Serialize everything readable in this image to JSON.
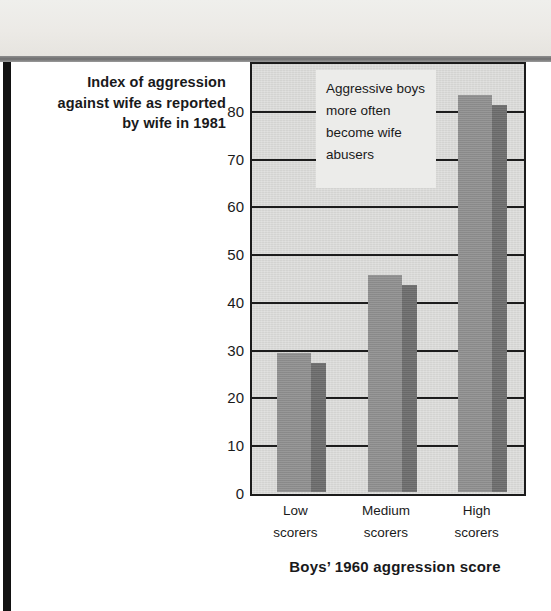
{
  "figure": {
    "y_axis_caption_lines": [
      "Index of aggression",
      "against wife as reported",
      "by wife in 1981"
    ],
    "x_axis_title": "Boys’ 1960 aggression score",
    "annotation_lines": [
      "Aggressive boys",
      "more often",
      "become wife",
      "abusers"
    ],
    "colors": {
      "bar_front": "#8f8f8f",
      "bar_side": "#6f6f6f",
      "plot_background": "#d3d3d1",
      "axis": "#1b1b1b",
      "callout_background": "#ececea"
    }
  },
  "chart_data": {
    "type": "bar",
    "title": "",
    "subtitle": "",
    "categories": [
      "Low scorers",
      "Medium scorers",
      "High scorers"
    ],
    "category_lines": [
      [
        "Low",
        "scorers"
      ],
      [
        "Medium",
        "scorers"
      ],
      [
        "High",
        "scorers"
      ]
    ],
    "values": [
      29,
      45.5,
      83
    ],
    "xlabel": "Boys’ 1960 aggression score",
    "ylabel": "Index of aggression against wife as reported by wife in 1981",
    "ylim": [
      0,
      90
    ],
    "yticks": [
      80,
      70,
      60,
      50,
      40,
      30,
      20,
      10,
      0
    ],
    "ytick_labels": [
      "80",
      "70",
      "60",
      "50",
      "40",
      "30",
      "20",
      "10",
      "0"
    ],
    "grid": true,
    "legend": "none",
    "annotations": [
      "Aggressive boys more often become wife abusers"
    ]
  }
}
